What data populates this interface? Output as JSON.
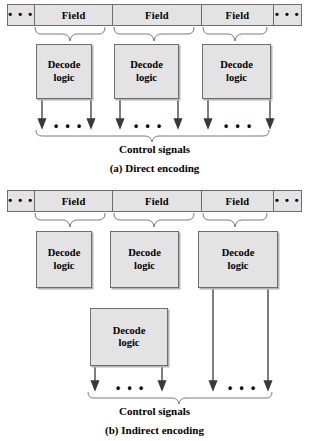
{
  "figure": {
    "ellipsis": "• • •",
    "decode_label_line1": "Decode",
    "decode_label_line2": "logic",
    "field_label": "Field",
    "control_signals_label": "Control signals"
  },
  "panel_a": {
    "caption": "(a) Direct encoding",
    "bar": {
      "cells": [
        {
          "type": "ellipsis",
          "label": "• • •"
        },
        {
          "type": "field",
          "label": "Field"
        },
        {
          "type": "field",
          "label": "Field"
        },
        {
          "type": "field",
          "label": "Field"
        },
        {
          "type": "ellipsis",
          "label": "• • •"
        }
      ]
    },
    "decode_boxes": [
      {
        "line1": "Decode",
        "line2": "logic"
      },
      {
        "line1": "Decode",
        "line2": "logic"
      },
      {
        "line1": "Decode",
        "line2": "logic"
      }
    ],
    "output_groups": 3,
    "arrows_per_group": 2,
    "control_signals_label": "Control signals"
  },
  "panel_b": {
    "caption": "(b) Indirect encoding",
    "bar": {
      "cells": [
        {
          "type": "ellipsis",
          "label": "• • •"
        },
        {
          "type": "field",
          "label": "Field"
        },
        {
          "type": "field",
          "label": "Field"
        },
        {
          "type": "field",
          "label": "Field"
        },
        {
          "type": "ellipsis",
          "label": "• • •"
        }
      ]
    },
    "decode_boxes_top": [
      {
        "line1": "Decode",
        "line2": "logic"
      },
      {
        "line1": "Decode",
        "line2": "logic"
      },
      {
        "line1": "Decode",
        "line2": "logic"
      }
    ],
    "decode_box_second_level": {
      "line1": "Decode",
      "line2": "logic"
    },
    "output_groups": 2,
    "arrows_per_group": 2,
    "control_signals_label": "Control signals"
  },
  "colors": {
    "box_fill": "#e3e3e3",
    "box_border": "#6d6d6d",
    "shadow": "#b4b4b4",
    "line": "#3a3a3a",
    "brace": "#7a7a7a",
    "text": "#000000",
    "background": "#ffffff"
  }
}
